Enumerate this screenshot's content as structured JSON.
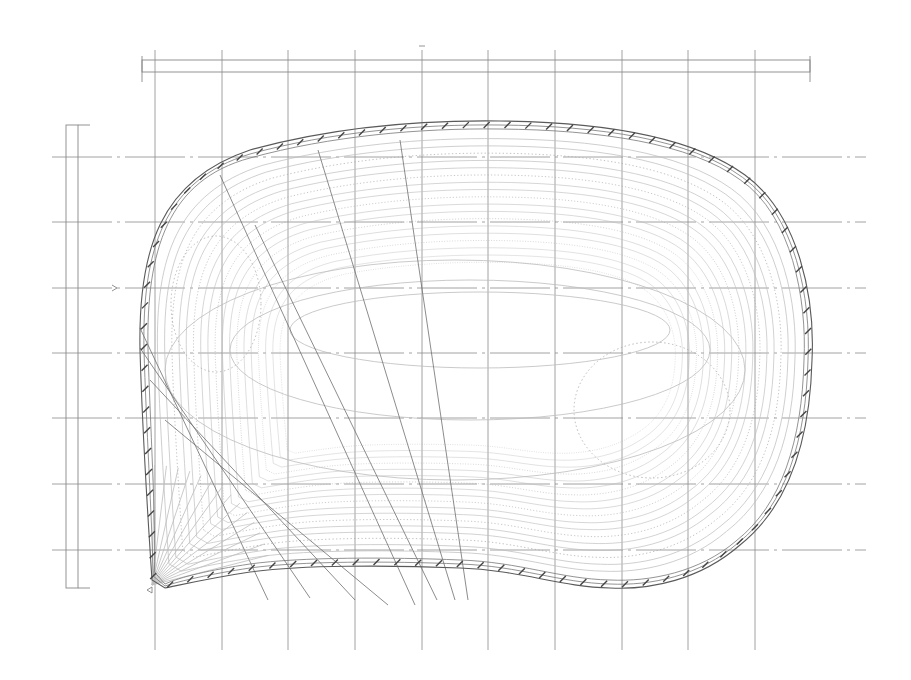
{
  "canvas": {
    "width": 911,
    "height": 680,
    "background": "#ffffff"
  },
  "colors": {
    "grid": "#8a8a8a",
    "outline": "#5a5a5a",
    "contour": "#bdbdbd",
    "hatch": "#444444"
  },
  "drawing": {
    "type": "technical contour plan (dish / tray shape)",
    "grid": {
      "vertical_x": [
        155,
        222,
        288,
        355,
        422,
        488,
        555,
        622,
        688,
        755
      ],
      "vertical_y_range": [
        50,
        650
      ],
      "horizontal_y": [
        157,
        222,
        288,
        353,
        418,
        484,
        550
      ],
      "horizontal_x_range": [
        52,
        866
      ]
    },
    "top_ruler": {
      "x1": 142,
      "x2": 810,
      "y1": 60,
      "y2": 72,
      "center_tick_x": 422
    },
    "left_ruler": {
      "x1": 66,
      "x2": 78,
      "y1": 125,
      "y2": 588
    },
    "outline_offsets": [
      0,
      4,
      8
    ],
    "contour_count": 18,
    "left_dotted_ellipse": {
      "cx": 216,
      "cy": 304,
      "rx": 45,
      "ry": 68
    },
    "right_dotted_ellipse": {
      "cx": 652,
      "cy": 410,
      "rx": 78,
      "ry": 68
    },
    "spokes": [
      [
        140,
        328,
        268,
        600
      ],
      [
        140,
        348,
        310,
        598
      ],
      [
        150,
        380,
        355,
        600
      ],
      [
        165,
        420,
        388,
        605
      ],
      [
        220,
        175,
        415,
        605
      ],
      [
        255,
        225,
        437,
        600
      ],
      [
        318,
        150,
        455,
        600
      ],
      [
        400,
        140,
        468,
        600
      ]
    ],
    "markers": [
      {
        "kind": "arrow-tick",
        "x": 112,
        "y": 288
      },
      {
        "kind": "triangle-tick",
        "x": 152,
        "y": 590
      }
    ]
  }
}
